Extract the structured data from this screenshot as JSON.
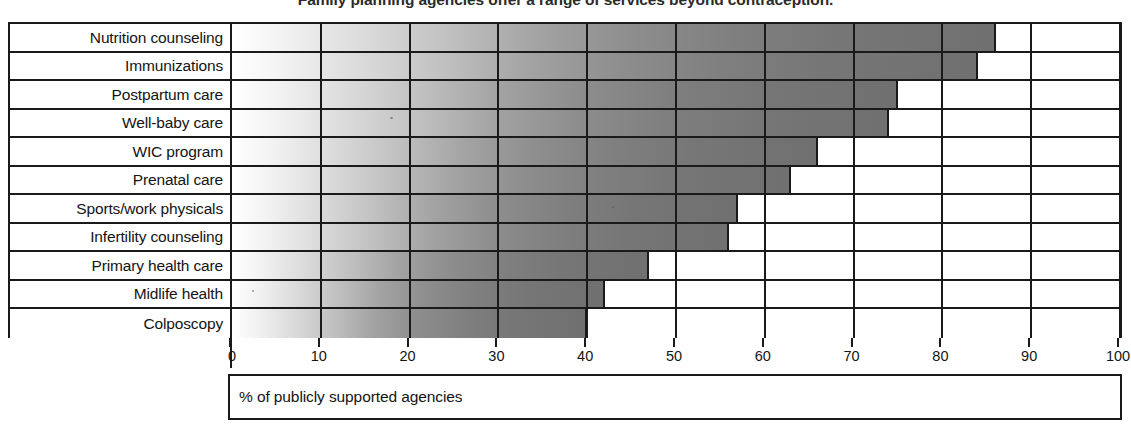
{
  "chart_data": {
    "type": "bar",
    "orientation": "horizontal",
    "title": "Family planning agencies offer a range of services beyond contraception.",
    "xlabel": "% of publicly supported agencies",
    "ylabel": "",
    "xlim": [
      0,
      100
    ],
    "xticks": [
      0,
      10,
      20,
      30,
      40,
      50,
      60,
      70,
      80,
      90,
      100
    ],
    "xtick_labels": [
      "0",
      "10",
      "20",
      "30",
      "40",
      "50",
      "60",
      "70",
      "80",
      "90",
      "100"
    ],
    "grid": true,
    "legend": "none",
    "categories": [
      "Nutrition counseling",
      "Immunizations",
      "Postpartum care",
      "Well-baby care",
      "WIC program",
      "Prenatal care",
      "Sports/work physicals",
      "Infertility counseling",
      "Primary health care",
      "Midlife health",
      "Colposcopy"
    ],
    "values": [
      86,
      84,
      75,
      74,
      66,
      63,
      57,
      56,
      47,
      42,
      40
    ],
    "series": [
      {
        "name": "% of publicly supported agencies",
        "values": [
          86,
          84,
          75,
          74,
          66,
          63,
          57,
          56,
          47,
          42,
          40
        ]
      }
    ],
    "bar_fill": "horizontal grayscale gradient, white at 0% to dark gray at right",
    "colors": {
      "bar_light": "#ffffff",
      "bar_dark": "#707070",
      "outline": "#1a1a1a",
      "background": "#ffffff"
    }
  },
  "caption": {
    "text": "% of publicly supported agencies"
  },
  "axis": {
    "min_label": "0",
    "max_label": "100"
  }
}
